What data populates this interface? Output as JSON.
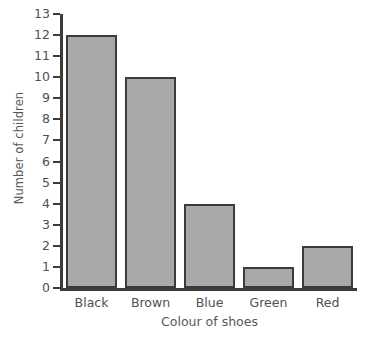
{
  "chart_data": {
    "type": "bar",
    "title": "",
    "subtitle": "",
    "xlabel": "Colour of shoes",
    "ylabel": "Number of children",
    "categories": [
      "Black",
      "Brown",
      "Blue",
      "Green",
      "Red"
    ],
    "values": [
      12,
      10,
      4,
      1,
      2
    ],
    "ylim": [
      0,
      13
    ],
    "ytick_labels": [
      "0",
      "1",
      "2",
      "3",
      "4",
      "5",
      "6",
      "7",
      "8",
      "9",
      "10",
      "11",
      "12",
      "13"
    ],
    "ytick_values": [
      0,
      1,
      2,
      3,
      4,
      5,
      6,
      7,
      8,
      9,
      10,
      11,
      12,
      13
    ],
    "grid": false,
    "legend": null,
    "annotations": [],
    "colors": {
      "bar_fill": "#a9a9a9",
      "bar_border": "#3b3b3b",
      "axis": "#3b3b3b",
      "text": "#4f4f4f",
      "background": "#ffffff"
    }
  }
}
